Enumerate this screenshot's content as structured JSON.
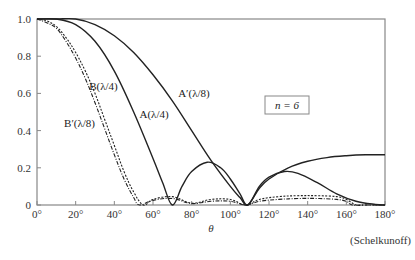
{
  "chart_data": {
    "type": "line",
    "title": "",
    "xlabel": "θ",
    "ylabel": "",
    "xlim": [
      0,
      180
    ],
    "ylim": [
      0,
      1.0
    ],
    "x_ticks": [
      "0°",
      "20°",
      "40°",
      "60°",
      "80°",
      "100°",
      "120°",
      "140°",
      "160°",
      "180°"
    ],
    "y_ticks": [
      "0",
      "0.2",
      "0.4",
      "0.6",
      "0.8",
      "1.0"
    ],
    "annotation_box": "n = 6",
    "credit": "(Schelkunoff)",
    "grid": false,
    "series": [
      {
        "name": "A(λ/4)",
        "style": "solid",
        "x": [
          0,
          10,
          20,
          30,
          40,
          50,
          60,
          65,
          70,
          75,
          80,
          88,
          95,
          100,
          105,
          109,
          115,
          120,
          128,
          135,
          145,
          155,
          165,
          175,
          180
        ],
        "values": [
          1.0,
          1.0,
          0.97,
          0.88,
          0.72,
          0.5,
          0.25,
          0.12,
          0.0,
          0.1,
          0.18,
          0.23,
          0.2,
          0.14,
          0.06,
          0.0,
          0.1,
          0.15,
          0.18,
          0.17,
          0.12,
          0.06,
          0.02,
          0.003,
          0.0
        ]
      },
      {
        "name": "A′(λ/8)",
        "style": "solid",
        "x": [
          0,
          10,
          20,
          30,
          40,
          50,
          60,
          70,
          80,
          90,
          100,
          105,
          109,
          115,
          120,
          130,
          140,
          150,
          160,
          170,
          180
        ],
        "values": [
          1.0,
          1.0,
          1.0,
          0.97,
          0.91,
          0.82,
          0.7,
          0.56,
          0.4,
          0.24,
          0.1,
          0.04,
          0.0,
          0.09,
          0.14,
          0.2,
          0.235,
          0.255,
          0.265,
          0.27,
          0.27
        ]
      },
      {
        "name": "B(λ/4)",
        "style": "dotted",
        "x": [
          0,
          5,
          10,
          15,
          20,
          25,
          30,
          35,
          40,
          45,
          50,
          55,
          60,
          70,
          80,
          90,
          100,
          108,
          115,
          125,
          135,
          145,
          155,
          160,
          165,
          170,
          180
        ],
        "values": [
          1.0,
          0.99,
          0.96,
          0.9,
          0.82,
          0.72,
          0.6,
          0.46,
          0.32,
          0.18,
          0.07,
          0.0,
          0.03,
          0.045,
          0.01,
          0.03,
          0.03,
          0.0,
          0.03,
          0.045,
          0.05,
          0.05,
          0.045,
          0.03,
          0.0,
          0.0,
          0.0
        ]
      },
      {
        "name": "B′(λ/8)",
        "style": "dash-dot",
        "x": [
          0,
          5,
          10,
          15,
          20,
          25,
          30,
          35,
          40,
          45,
          50,
          53,
          60,
          70,
          80,
          90,
          100,
          108,
          115,
          125,
          135,
          145,
          155,
          160,
          163,
          170,
          180
        ],
        "values": [
          1.0,
          0.98,
          0.95,
          0.88,
          0.79,
          0.68,
          0.55,
          0.41,
          0.27,
          0.14,
          0.04,
          0.0,
          0.025,
          0.035,
          0.008,
          0.02,
          0.02,
          0.0,
          0.02,
          0.03,
          0.035,
          0.035,
          0.03,
          0.02,
          0.0,
          0.0,
          0.0
        ]
      }
    ],
    "labels": [
      {
        "series": "A′(λ/8)",
        "text": "A′(λ/8)",
        "x_deg": 73,
        "y_val": 0.58
      },
      {
        "series": "A(λ/4)",
        "text": "A(λ/4)",
        "x_deg": 53,
        "y_val": 0.47
      },
      {
        "series": "B(λ/4)",
        "text": "B(λ/4)",
        "x_deg": 27,
        "y_val": 0.62
      },
      {
        "series": "B′(λ/8)",
        "text": "B′(λ/8)",
        "x_deg": 14,
        "y_val": 0.42
      }
    ],
    "colors": {
      "axis": "#888888",
      "curve": "#222222",
      "text": "#333333"
    }
  }
}
